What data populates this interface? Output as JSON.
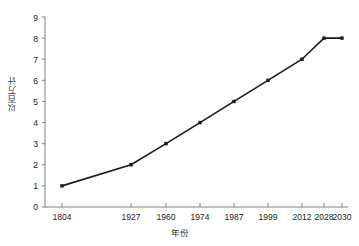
{
  "chart_data": {
    "type": "line",
    "title": "",
    "subtitle": "",
    "xlabel": "年份",
    "ylabel": "以百万计",
    "categories": [
      "1804",
      "1927",
      "1960",
      "1974",
      "1987",
      "1999",
      "2012",
      "2028",
      "2030"
    ],
    "x": [
      1804,
      1927,
      1960,
      1974,
      1987,
      1999,
      2012,
      2028,
      2030
    ],
    "values": [
      1,
      2,
      3,
      4,
      5,
      6,
      7,
      8,
      8
    ],
    "series": [
      {
        "name": "",
        "values": [
          1,
          2,
          3,
          4,
          5,
          6,
          7,
          8,
          8
        ]
      }
    ],
    "yticks": [
      "0",
      "1",
      "2",
      "3",
      "4",
      "5",
      "6",
      "7",
      "8",
      "9"
    ],
    "ylim": [
      0,
      9
    ],
    "grid": false,
    "legend": false,
    "legend_position": "none",
    "marker": "square",
    "line_color": "#1a1a1a",
    "marker_color": "#1a1a1a",
    "axis_color": "#808080",
    "background_color": "#ffffff",
    "annotations": []
  }
}
